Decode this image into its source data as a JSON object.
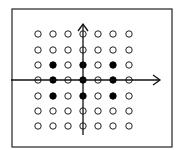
{
  "diagram": {
    "frame": {
      "x": 12,
      "y": 9,
      "width": 160,
      "height": 138,
      "stroke": "#222222"
    },
    "grid": {
      "cols_x": [
        38,
        53,
        68,
        83,
        98,
        113,
        129
      ],
      "rows_y": [
        34,
        50,
        65,
        80,
        96,
        111,
        126
      ],
      "radius": 3.2,
      "open_stroke": "#222222",
      "filled_color": "#000000"
    },
    "filled_points": [
      [
        2,
        1
      ],
      [
        2,
        3
      ],
      [
        2,
        5
      ],
      [
        3,
        1
      ],
      [
        3,
        3
      ],
      [
        3,
        5
      ],
      [
        4,
        1
      ],
      [
        4,
        3
      ],
      [
        4,
        5
      ]
    ],
    "axes": {
      "x_axis": {
        "y": 80,
        "x1": 11,
        "x2": 160
      },
      "y_axis": {
        "x": 83,
        "y1": 135,
        "y2": 24
      },
      "color": "#111111"
    }
  }
}
